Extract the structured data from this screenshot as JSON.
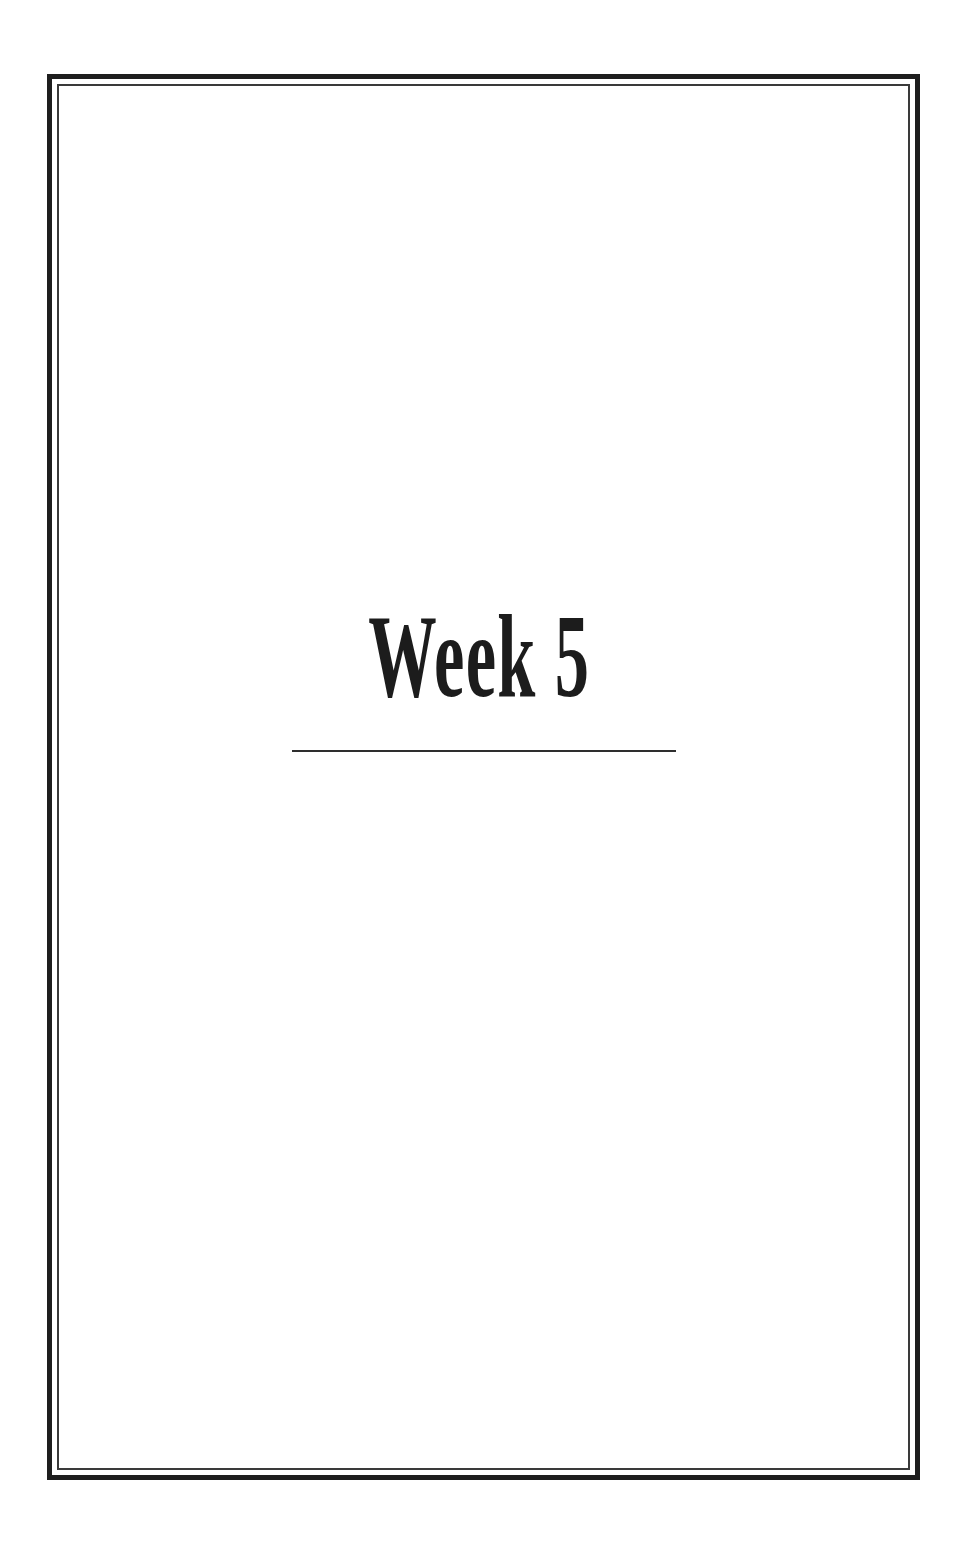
{
  "page": {
    "title": "Week 5",
    "colors": {
      "background": "#ffffff",
      "frame": "#1e1e1e",
      "text": "#1c1c1c",
      "rule": "#2e2e2e"
    }
  }
}
